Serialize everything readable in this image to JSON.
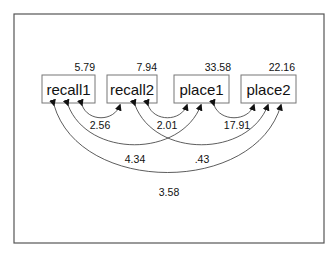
{
  "diagram": {
    "type": "path-diagram-covariances",
    "variables": [
      {
        "name": "recall1",
        "variance": "5.79"
      },
      {
        "name": "recall2",
        "variance": "7.94"
      },
      {
        "name": "place1",
        "variance": "33.58"
      },
      {
        "name": "place2",
        "variance": "22.16"
      }
    ],
    "covariances": [
      {
        "from": "recall1",
        "to": "recall2",
        "value": "2.56"
      },
      {
        "from": "recall2",
        "to": "place1",
        "value": "2.01"
      },
      {
        "from": "place1",
        "to": "place2",
        "value": "17.91"
      },
      {
        "from": "recall1",
        "to": "place1",
        "value": "4.34"
      },
      {
        "from": "recall2",
        "to": "place2",
        "value": ".43"
      },
      {
        "from": "recall1",
        "to": "place2",
        "value": "3.58"
      }
    ]
  }
}
